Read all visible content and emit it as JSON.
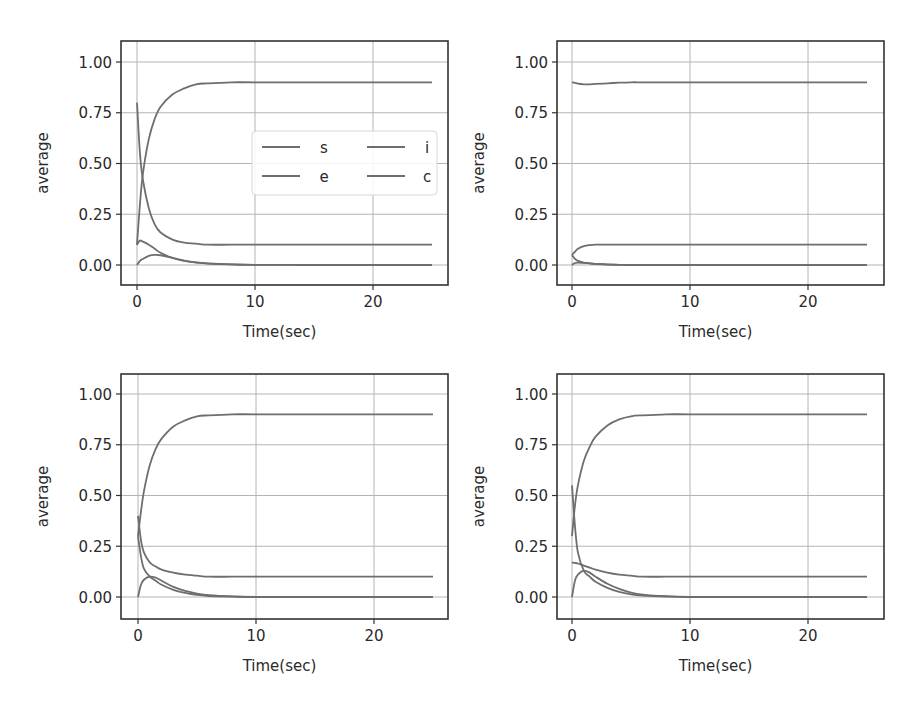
{
  "figure": {
    "width": 916,
    "height": 717
  },
  "style": {
    "line_color": "#6e6e6e",
    "grid_color": "#b4b4b4",
    "frame_color": "#333333",
    "text_color": "#2a2a2a"
  },
  "chart_data": [
    {
      "id": "top-left",
      "type": "line",
      "title": "",
      "xlabel": "Time(sec)",
      "ylabel": "average",
      "xlim": [
        -1.25,
        26.25
      ],
      "ylim": [
        -0.1,
        1.1
      ],
      "xticks": [
        0,
        10,
        20
      ],
      "xtick_labels": [
        "0",
        "10",
        "20"
      ],
      "yticks": [
        0.0,
        0.25,
        0.5,
        0.75,
        1.0
      ],
      "ytick_labels": [
        "0.00",
        "0.25",
        "0.50",
        "0.75",
        "1.00"
      ],
      "grid": true,
      "legend": {
        "visible": true,
        "position": "center right",
        "ncol": 2,
        "entries": [
          "s",
          "i",
          "e",
          "c"
        ]
      },
      "x": [
        0,
        0.25,
        0.5,
        1,
        1.5,
        2,
        3,
        4,
        5,
        6,
        8,
        10,
        15,
        20,
        25
      ],
      "series": [
        {
          "name": "s",
          "values": [
            0.1,
            0.3,
            0.45,
            0.62,
            0.72,
            0.78,
            0.84,
            0.87,
            0.89,
            0.895,
            0.9,
            0.9,
            0.9,
            0.9,
            0.9
          ]
        },
        {
          "name": "e",
          "values": [
            0.8,
            0.55,
            0.42,
            0.28,
            0.2,
            0.16,
            0.125,
            0.11,
            0.105,
            0.1,
            0.1,
            0.1,
            0.1,
            0.1,
            0.1
          ]
        },
        {
          "name": "i",
          "values": [
            0.1,
            0.12,
            0.115,
            0.1,
            0.08,
            0.06,
            0.035,
            0.02,
            0.012,
            0.007,
            0.003,
            0.001,
            0.0,
            0.0,
            0.0
          ]
        },
        {
          "name": "c",
          "values": [
            0.0,
            0.02,
            0.03,
            0.045,
            0.05,
            0.048,
            0.035,
            0.022,
            0.013,
            0.008,
            0.003,
            0.001,
            0.0,
            0.0,
            0.0
          ]
        }
      ]
    },
    {
      "id": "top-right",
      "type": "line",
      "title": "",
      "xlabel": "Time(sec)",
      "ylabel": "average",
      "xlim": [
        -1.25,
        26.25
      ],
      "ylim": [
        -0.1,
        1.1
      ],
      "xticks": [
        0,
        10,
        20
      ],
      "xtick_labels": [
        "0",
        "10",
        "20"
      ],
      "yticks": [
        0.0,
        0.25,
        0.5,
        0.75,
        1.0
      ],
      "ytick_labels": [
        "0.00",
        "0.25",
        "0.50",
        "0.75",
        "1.00"
      ],
      "grid": true,
      "legend": {
        "visible": false
      },
      "x": [
        0,
        0.25,
        0.5,
        1,
        1.5,
        2,
        3,
        4,
        5,
        6,
        8,
        10,
        15,
        20,
        25
      ],
      "series": [
        {
          "name": "s",
          "values": [
            0.9,
            0.897,
            0.893,
            0.89,
            0.89,
            0.892,
            0.895,
            0.898,
            0.9,
            0.9,
            0.9,
            0.9,
            0.9,
            0.9,
            0.9
          ]
        },
        {
          "name": "e",
          "values": [
            0.05,
            0.065,
            0.08,
            0.093,
            0.098,
            0.1,
            0.1,
            0.1,
            0.1,
            0.1,
            0.1,
            0.1,
            0.1,
            0.1,
            0.1
          ]
        },
        {
          "name": "i",
          "values": [
            0.05,
            0.03,
            0.02,
            0.012,
            0.008,
            0.005,
            0.002,
            0.001,
            0.0,
            0.0,
            0.0,
            0.0,
            0.0,
            0.0,
            0.0
          ]
        },
        {
          "name": "c",
          "values": [
            0.0,
            0.01,
            0.012,
            0.01,
            0.008,
            0.006,
            0.003,
            0.001,
            0.0,
            0.0,
            0.0,
            0.0,
            0.0,
            0.0,
            0.0
          ]
        }
      ]
    },
    {
      "id": "bottom-left",
      "type": "line",
      "title": "",
      "xlabel": "Time(sec)",
      "ylabel": "average",
      "xlim": [
        -1.25,
        26.25
      ],
      "ylim": [
        -0.1,
        1.1
      ],
      "xticks": [
        0,
        10,
        20
      ],
      "xtick_labels": [
        "0",
        "10",
        "20"
      ],
      "yticks": [
        0.0,
        0.25,
        0.5,
        0.75,
        1.0
      ],
      "ytick_labels": [
        "0.00",
        "0.25",
        "0.50",
        "0.75",
        "1.00"
      ],
      "grid": true,
      "legend": {
        "visible": false
      },
      "x": [
        0,
        0.25,
        0.5,
        1,
        1.5,
        2,
        3,
        4,
        5,
        6,
        8,
        10,
        15,
        20,
        25
      ],
      "series": [
        {
          "name": "s",
          "values": [
            0.3,
            0.42,
            0.52,
            0.65,
            0.73,
            0.78,
            0.84,
            0.87,
            0.89,
            0.895,
            0.9,
            0.9,
            0.9,
            0.9,
            0.9
          ]
        },
        {
          "name": "e",
          "values": [
            0.4,
            0.28,
            0.22,
            0.17,
            0.15,
            0.135,
            0.12,
            0.11,
            0.105,
            0.1,
            0.1,
            0.1,
            0.1,
            0.1,
            0.1
          ]
        },
        {
          "name": "i",
          "values": [
            0.3,
            0.2,
            0.14,
            0.1,
            0.08,
            0.06,
            0.035,
            0.02,
            0.01,
            0.005,
            0.002,
            0.0,
            0.0,
            0.0,
            0.0
          ]
        },
        {
          "name": "c",
          "values": [
            0.0,
            0.06,
            0.085,
            0.1,
            0.095,
            0.08,
            0.05,
            0.03,
            0.017,
            0.009,
            0.003,
            0.001,
            0.0,
            0.0,
            0.0
          ]
        }
      ]
    },
    {
      "id": "bottom-right",
      "type": "line",
      "title": "",
      "xlabel": "Time(sec)",
      "ylabel": "average",
      "xlim": [
        -1.25,
        26.25
      ],
      "ylim": [
        -0.1,
        1.1
      ],
      "xticks": [
        0,
        10,
        20
      ],
      "xtick_labels": [
        "0",
        "10",
        "20"
      ],
      "yticks": [
        0.0,
        0.25,
        0.5,
        0.75,
        1.0
      ],
      "ytick_labels": [
        "0.00",
        "0.25",
        "0.50",
        "0.75",
        "1.00"
      ],
      "grid": true,
      "legend": {
        "visible": false
      },
      "x": [
        0,
        0.25,
        0.5,
        1,
        1.5,
        2,
        3,
        4,
        5,
        6,
        8,
        10,
        15,
        20,
        25
      ],
      "series": [
        {
          "name": "s",
          "values": [
            0.3,
            0.45,
            0.55,
            0.67,
            0.74,
            0.79,
            0.845,
            0.875,
            0.89,
            0.895,
            0.9,
            0.9,
            0.9,
            0.9,
            0.9
          ]
        },
        {
          "name": "e",
          "values": [
            0.17,
            0.168,
            0.165,
            0.155,
            0.145,
            0.135,
            0.12,
            0.11,
            0.105,
            0.1,
            0.1,
            0.1,
            0.1,
            0.1,
            0.1
          ]
        },
        {
          "name": "i",
          "values": [
            0.55,
            0.35,
            0.22,
            0.13,
            0.1,
            0.075,
            0.045,
            0.025,
            0.013,
            0.007,
            0.002,
            0.0,
            0.0,
            0.0,
            0.0
          ]
        },
        {
          "name": "c",
          "values": [
            0.0,
            0.08,
            0.11,
            0.13,
            0.12,
            0.1,
            0.065,
            0.04,
            0.022,
            0.012,
            0.004,
            0.001,
            0.0,
            0.0,
            0.0
          ]
        }
      ]
    }
  ]
}
